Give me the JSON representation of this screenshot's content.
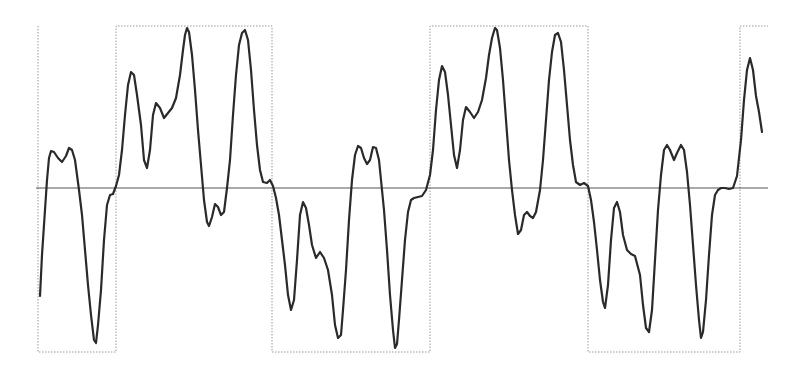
{
  "figure": {
    "colors": {
      "waveform": "#2a2a2a",
      "reference": "#9a9a9a",
      "baseline": "#555555",
      "background": "#ffffff"
    }
  }
}
